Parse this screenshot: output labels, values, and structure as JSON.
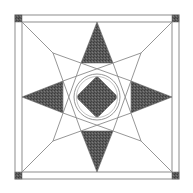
{
  "figure": {
    "title": "",
    "size": 193,
    "colors": {
      "background": "#ffffff",
      "line": "#8a8a8a",
      "frame": "#a0a0a0",
      "fill": "#555555",
      "corner": "#505050"
    },
    "frame": {
      "outer": [
        15,
        15,
        179,
        179
      ],
      "inner": [
        22,
        22,
        172,
        172
      ]
    },
    "center": [
      97,
      97
    ],
    "circle_radius": 21,
    "diamond_radius": 19,
    "labels": []
  }
}
